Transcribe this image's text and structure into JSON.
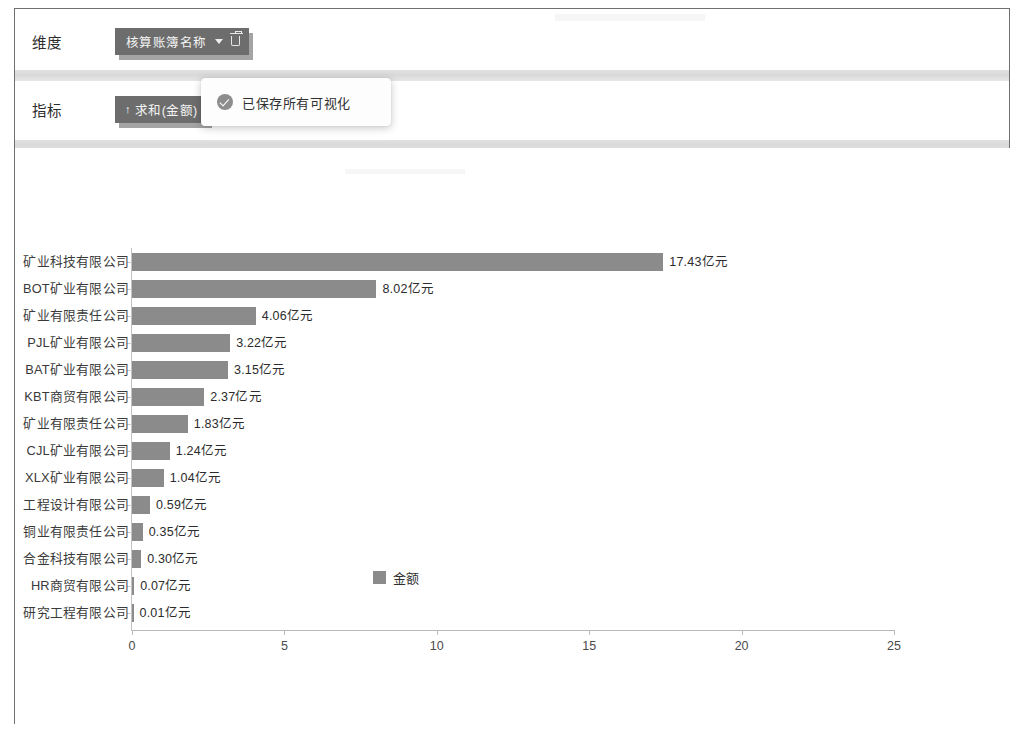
{
  "config": {
    "dimension": {
      "label": "维度",
      "tag_text": "核算账簿名称",
      "caret_icon": "chevron-down-icon",
      "delete_icon": "trash-icon"
    },
    "metric": {
      "label": "指标",
      "sort_arrow": "↑",
      "tag_text": "求和(金额)"
    }
  },
  "toast": {
    "icon": "check-circle-icon",
    "message": "已保存所有可视化"
  },
  "colors": {
    "bar": "#8b8b8b",
    "tag_background": "#6d6d6d",
    "axis": "#bdbdbd"
  },
  "chart_data": {
    "type": "bar",
    "orientation": "horizontal",
    "title": "",
    "xlabel": "",
    "ylabel": "",
    "xlim": [
      0,
      25
    ],
    "xticks": [
      "0",
      "5",
      "10",
      "15",
      "20",
      "25"
    ],
    "grid": false,
    "legend": {
      "position": "bottom",
      "entries": [
        "金额"
      ]
    },
    "unit_suffix": "亿元",
    "categories": [
      "矿业科技有限公司",
      "BOT矿业有限公司",
      "矿业有限责任公司",
      "PJL矿业有限公司",
      "BAT矿业有限公司",
      "KBT商贸有限公司",
      "矿业有限责任公司",
      "CJL矿业有限公司",
      "XLX矿业有限公司",
      "工程设计有限公司",
      "铜业有限责任公司",
      "合金科技有限公司",
      "HR商贸有限公司",
      "研究工程有限公司"
    ],
    "values": [
      17.43,
      8.02,
      4.06,
      3.22,
      3.15,
      2.37,
      1.83,
      1.24,
      1.04,
      0.59,
      0.35,
      0.3,
      0.07,
      0.01
    ],
    "value_labels": [
      "17.43亿元",
      "8.02亿元",
      "4.06亿元",
      "3.22亿元",
      "3.15亿元",
      "2.37亿元",
      "1.83亿元",
      "1.24亿元",
      "1.04亿元",
      "0.59亿元",
      "0.35亿元",
      "0.30亿元",
      "0.07亿元",
      "0.01亿元"
    ]
  }
}
